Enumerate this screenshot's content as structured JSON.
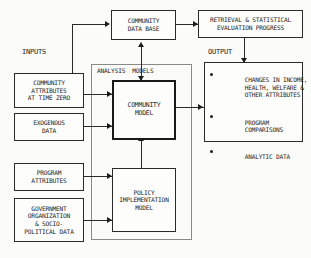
{
  "diagram": {
    "labels": {
      "inputs": "INPUTS",
      "analysis_models": "ANALYSIS  MODELS",
      "output": "OUTPUT"
    },
    "boxes": {
      "community_data_base": {
        "line1": "COMMUNITY",
        "line2": "DATA BASE"
      },
      "retrieval_program": {
        "line1": "RETRIEVAL & STATISTICAL",
        "line2": "EVALUATION PROGRESS"
      },
      "community_attributes": {
        "line1": "COMMUNITY",
        "line2": "ATTRIBUTES",
        "line3": "AT TIME ZERO"
      },
      "exogenous_data": {
        "line1": "EXOGENOUS",
        "line2": "DATA"
      },
      "program_attributes": {
        "line1": "PROGRAM",
        "line2": "ATTRIBUTES"
      },
      "government_organization": {
        "line1": "GOVERNMENT",
        "line2": "ORGANIZATION",
        "line3": "& SOCIO-",
        "line4": "POLITICAL DATA"
      },
      "community_model": {
        "line1": "COMMUNITY",
        "line2": "MODEL"
      },
      "policy_model": {
        "line1": "POLICY",
        "line2": "IMPLEMENTATION",
        "line3": "MODEL"
      }
    },
    "output_items": [
      {
        "line1": "CHANGES IN INCOME,",
        "line2": "HEALTH, WELFARE &",
        "line3": "OTHER ATTRIBUTES"
      },
      {
        "line1": "PROGRAM",
        "line2": "COMPARISONS"
      },
      {
        "line1": "ANALYTIC DATA"
      }
    ],
    "colors": {
      "ink": "#1c1c1c",
      "border": "#2a2a2a",
      "container_border": "#8a8a86",
      "background": "#fbfbfa"
    }
  }
}
